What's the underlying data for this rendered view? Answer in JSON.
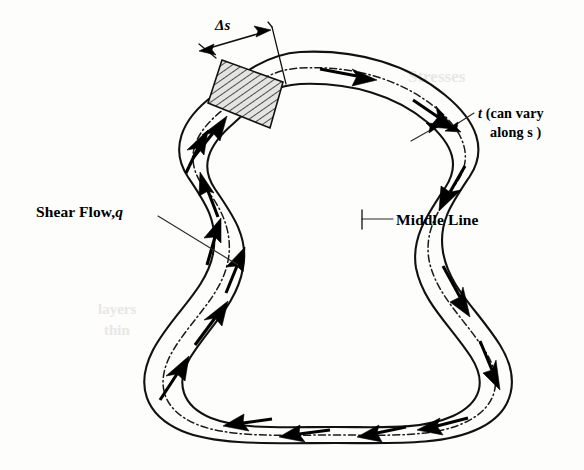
{
  "figure": {
    "background_color": "#fdfdfc",
    "ink_color": "#111111",
    "width": 584,
    "height": 470
  },
  "labels": {
    "shear_flow": {
      "text_before": "Shear  Flow,",
      "symbol": "q",
      "full": "Shear Flow, q"
    },
    "middle_line": {
      "full": "Middle Line"
    },
    "thickness": {
      "symbol": "t",
      "line1": " (can vary",
      "line2": "along s )",
      "full": "t (can vary along s )"
    },
    "delta_s": {
      "full": "Δs"
    }
  },
  "annotations": {
    "hatched_element_note": "element of wall of length Δs spanning full thickness t",
    "flow_direction": "clockwise",
    "middle_line_style": "dash-dot",
    "arrow_count": 16
  },
  "ghost_text": {
    "top_right": "Stresses",
    "left_mid": "layers",
    "left_low": "thin"
  }
}
